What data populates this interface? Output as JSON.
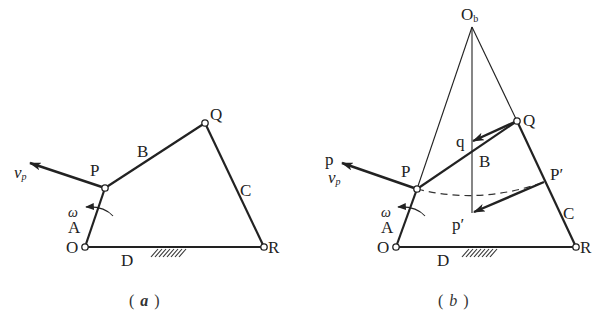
{
  "figure": {
    "panels": [
      {
        "id": "a",
        "caption": "a",
        "labels": {
          "O": "O",
          "P": "P",
          "Q": "Q",
          "R": "R",
          "A": "A",
          "B": "B",
          "C": "C",
          "D": "D",
          "omega": "ω",
          "vp": "v",
          "vp_sub": "p"
        },
        "links": [
          {
            "name": "A",
            "from": "O",
            "to": "P"
          },
          {
            "name": "B",
            "from": "P",
            "to": "Q"
          },
          {
            "name": "C",
            "from": "Q",
            "to": "R"
          },
          {
            "name": "D",
            "from": "O",
            "to": "R",
            "fixed": true
          }
        ]
      },
      {
        "id": "b",
        "caption": "b",
        "labels": {
          "O": "O",
          "P": "P",
          "Q": "Q",
          "R": "R",
          "A": "A",
          "B": "B",
          "C": "C",
          "D": "D",
          "Ob": "O",
          "Ob_sub": "b",
          "p": "p",
          "q": "q",
          "p_prime": "p′",
          "P_prime": "P′",
          "omega": "ω",
          "vp": "v",
          "vp_sub": "p"
        },
        "construction": [
          "Extend OP and RQ to meet at instant center Ob",
          "Vertical line from Ob through B",
          "Arc from P to P′ about Ob (dashed)",
          "Vector Qq and vector P′p′"
        ]
      }
    ],
    "captions": {
      "a_open": "(",
      "a_text": "a",
      "a_close": ")",
      "b_open": "(",
      "b_text": "b",
      "b_close": ")"
    }
  }
}
